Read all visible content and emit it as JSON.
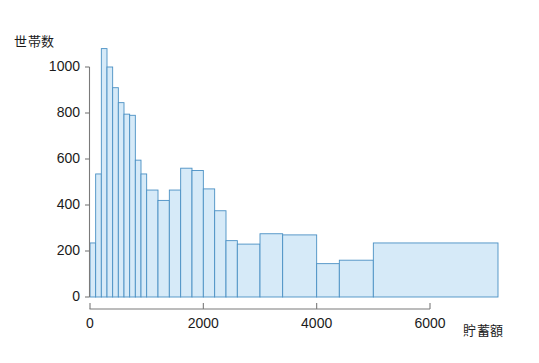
{
  "chart_data": {
    "type": "bar",
    "title": "",
    "subtitle": "",
    "xlabel": "貯蓄額",
    "ylabel": "世帯数",
    "xlim": [
      0,
      7200
    ],
    "ylim": [
      0,
      1100
    ],
    "grid": false,
    "legend": null,
    "annotations": [],
    "x_ticks": [
      0,
      2000,
      4000,
      6000
    ],
    "x_tick_labels": [
      "0",
      "2000",
      "4000",
      "6000"
    ],
    "y_ticks": [
      0,
      200,
      400,
      600,
      800,
      1000
    ],
    "y_tick_labels": [
      "0",
      "200",
      "400",
      "600",
      "800",
      "1000"
    ],
    "bin_edges": [
      0,
      100,
      200,
      300,
      400,
      500,
      600,
      700,
      800,
      900,
      1000,
      1200,
      1400,
      1600,
      1800,
      2000,
      2200,
      2400,
      2600,
      3000,
      3400,
      4000,
      4400,
      5000,
      7200
    ],
    "values": [
      235,
      535,
      1080,
      1000,
      910,
      845,
      795,
      790,
      595,
      535,
      465,
      420,
      465,
      560,
      550,
      470,
      375,
      245,
      230,
      275,
      270,
      145,
      160,
      235
    ],
    "bars": [
      {
        "x0": 0,
        "x1": 100,
        "height": 235
      },
      {
        "x0": 100,
        "x1": 200,
        "height": 535
      },
      {
        "x0": 200,
        "x1": 300,
        "height": 1080
      },
      {
        "x0": 300,
        "x1": 400,
        "height": 1000
      },
      {
        "x0": 400,
        "x1": 500,
        "height": 910
      },
      {
        "x0": 500,
        "x1": 600,
        "height": 845
      },
      {
        "x0": 600,
        "x1": 700,
        "height": 795
      },
      {
        "x0": 700,
        "x1": 800,
        "height": 790
      },
      {
        "x0": 800,
        "x1": 900,
        "height": 595
      },
      {
        "x0": 900,
        "x1": 1000,
        "height": 535
      },
      {
        "x0": 1000,
        "x1": 1200,
        "height": 465
      },
      {
        "x0": 1200,
        "x1": 1400,
        "height": 420
      },
      {
        "x0": 1400,
        "x1": 1600,
        "height": 465
      },
      {
        "x0": 1600,
        "x1": 1800,
        "height": 560
      },
      {
        "x0": 1800,
        "x1": 2000,
        "height": 550
      },
      {
        "x0": 2000,
        "x1": 2200,
        "height": 470
      },
      {
        "x0": 2200,
        "x1": 2400,
        "height": 375
      },
      {
        "x0": 2400,
        "x1": 2600,
        "height": 245
      },
      {
        "x0": 2600,
        "x1": 3000,
        "height": 230
      },
      {
        "x0": 3000,
        "x1": 3400,
        "height": 275
      },
      {
        "x0": 3400,
        "x1": 4000,
        "height": 270
      },
      {
        "x0": 4000,
        "x1": 4400,
        "height": 145
      },
      {
        "x0": 4400,
        "x1": 5000,
        "height": 160
      },
      {
        "x0": 5000,
        "x1": 7200,
        "height": 235
      }
    ],
    "colors": {
      "bar_fill": "#d6eaf8",
      "bar_stroke": "#4a90c4",
      "axis": "#7a7a7a",
      "text": "#1b1b1b",
      "background": "#ffffff"
    }
  }
}
